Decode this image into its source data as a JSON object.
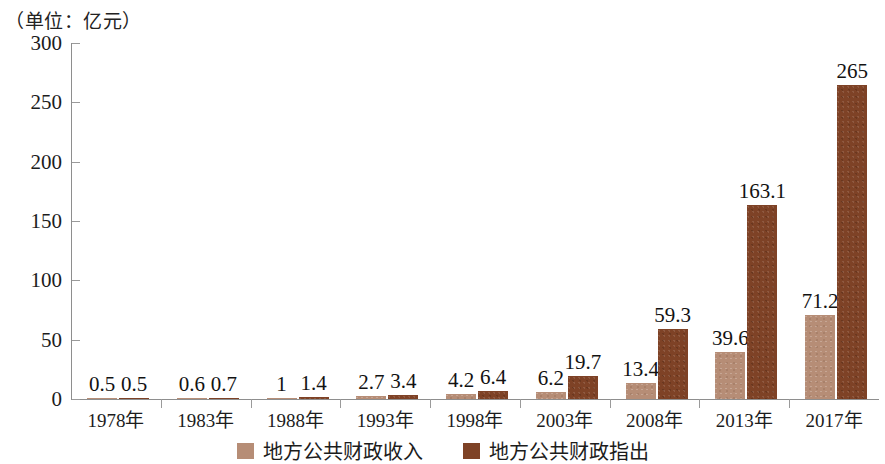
{
  "chart_data": {
    "type": "bar",
    "title": "（单位：亿元）",
    "xlabel": "",
    "ylabel": "",
    "ylim": [
      0,
      300
    ],
    "yticks": [
      0,
      50,
      100,
      150,
      200,
      250,
      300
    ],
    "grid": false,
    "legend_position": "bottom",
    "categories": [
      "1978年",
      "1983年",
      "1988年",
      "1993年",
      "1998年",
      "2003年",
      "2008年",
      "2013年",
      "2017年"
    ],
    "series": [
      {
        "name": "地方公共财政收入",
        "color": "#b68d76",
        "values": [
          0.5,
          0.6,
          1,
          2.7,
          4.2,
          6.2,
          13.4,
          39.6,
          71.2
        ],
        "labels": [
          "0.5",
          "0.6",
          "1",
          "2.7",
          "4.2",
          "6.2",
          "13.4",
          "39.6",
          "71.2"
        ]
      },
      {
        "name": "地方公共财政指出",
        "color": "#7e4226",
        "values": [
          0.5,
          0.7,
          1.4,
          3.4,
          6.4,
          19.7,
          59.3,
          163.1,
          265
        ],
        "labels": [
          "0.5",
          "0.7",
          "1.4",
          "3.4",
          "6.4",
          "19.7",
          "59.3",
          "163.1",
          "265"
        ]
      }
    ]
  },
  "yticklabels": [
    "300",
    "250",
    "200",
    "150",
    "100",
    "50",
    "0"
  ]
}
